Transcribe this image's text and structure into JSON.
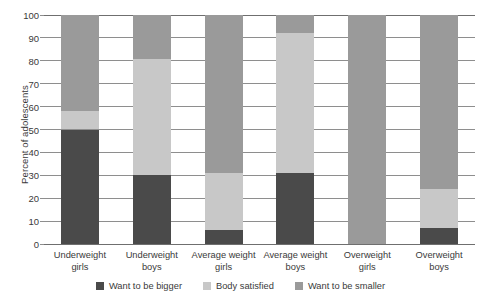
{
  "chart_data": {
    "type": "bar",
    "subtype": "stacked-bar",
    "title": "",
    "xlabel": "",
    "ylabel": "Percent of adolescents",
    "ylim": [
      0,
      100
    ],
    "yticks": [
      0,
      10,
      20,
      30,
      40,
      50,
      60,
      70,
      80,
      90,
      100
    ],
    "ytick_labels": [
      "0",
      "10",
      "20",
      "30",
      "40",
      "50",
      "60",
      "70",
      "80",
      "90",
      "100"
    ],
    "grid": true,
    "legend_position": "bottom",
    "categories": [
      "Underweight girls",
      "Underweight boys",
      "Average weight girls",
      "Average weight boys",
      "Overweight girls",
      "Overweight boys"
    ],
    "category_lines": [
      [
        "Underweight",
        "girls"
      ],
      [
        "Underweight",
        "boys"
      ],
      [
        "Average weight",
        "girls"
      ],
      [
        "Average weight",
        "boys"
      ],
      [
        "Overweight",
        "girls"
      ],
      [
        "Overweight",
        "boys"
      ]
    ],
    "series": [
      {
        "name": "Want to be bigger",
        "color": "#4a4a4a",
        "values": [
          50,
          30,
          6,
          31,
          0,
          7
        ]
      },
      {
        "name": "Body satisfied",
        "color": "#c8c8c8",
        "values": [
          8,
          51,
          25,
          61,
          0,
          17
        ]
      },
      {
        "name": "Want to be smaller",
        "color": "#9a9a9a",
        "values": [
          42,
          19,
          69,
          8,
          100,
          76
        ]
      }
    ]
  },
  "colors": {
    "want_bigger": "#4a4a4a",
    "body_satisfied": "#c8c8c8",
    "want_smaller": "#9a9a9a",
    "gridline": "#8e8e8e",
    "axis": "#6f6f6f",
    "text": "#3a3a3a",
    "background": "#ffffff"
  },
  "axis": {
    "ylabel": "Percent of adolescents"
  },
  "legend": {
    "items": [
      {
        "label": "Want to be bigger",
        "color": "#4a4a4a"
      },
      {
        "label": "Body satisfied",
        "color": "#c8c8c8"
      },
      {
        "label": "Want to be smaller",
        "color": "#9a9a9a"
      }
    ]
  }
}
